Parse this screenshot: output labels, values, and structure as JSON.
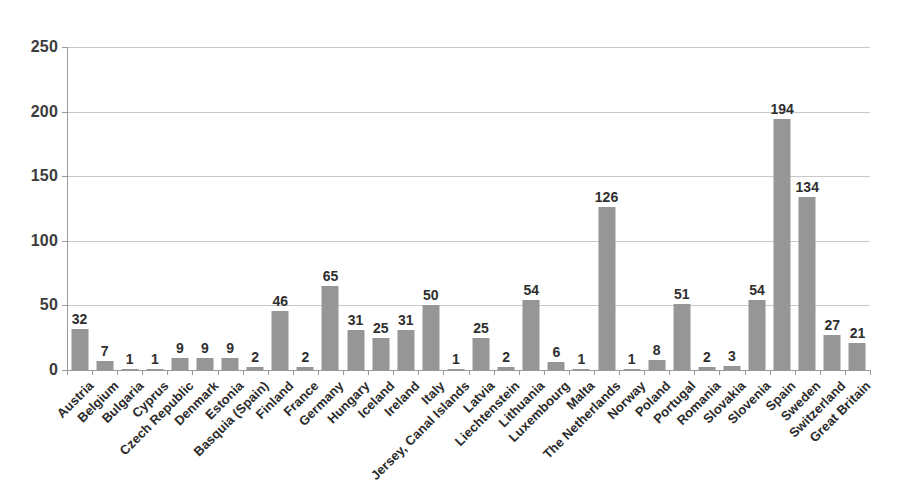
{
  "chart_data": {
    "type": "bar",
    "title": "",
    "subtitle": "",
    "xlabel": "",
    "ylabel": "",
    "ylim": [
      0,
      250
    ],
    "yticks": [
      0,
      50,
      100,
      150,
      200,
      250
    ],
    "grid": true,
    "legend": false,
    "legend_position": "none",
    "bar_color": "#969696",
    "gridline_color": "#c8c8c8",
    "axis_color": "#9a9a9a",
    "categories": [
      "Austria",
      "Belgium",
      "Bulgaria",
      "Cyprus",
      "Czech Republic",
      "Denmark",
      "Estonia",
      "Basquia (Spain)",
      "Finland",
      "France",
      "Germany",
      "Hungary",
      "Iceland",
      "Ireland",
      "Italy",
      "Jersey, Canal Islands",
      "Latvia",
      "Liechtenstein",
      "Lithuania",
      "Luxembourg",
      "Malta",
      "The Netherlands",
      "Norway",
      "Poland",
      "Portugal",
      "Romania",
      "Slovakia",
      "Slovenia",
      "Spain",
      "Sweden",
      "Switzerland",
      "Great Britain"
    ],
    "values": [
      32,
      7,
      1,
      1,
      9,
      9,
      9,
      2,
      46,
      2,
      65,
      31,
      25,
      31,
      50,
      1,
      25,
      2,
      54,
      6,
      1,
      126,
      1,
      8,
      51,
      2,
      3,
      54,
      194,
      134,
      27,
      21
    ]
  }
}
